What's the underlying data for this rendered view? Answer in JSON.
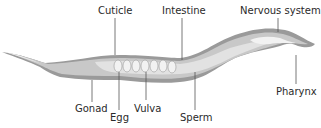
{
  "diagram": {
    "labels": {
      "cuticle": "Cuticle",
      "intestine": "Intestine",
      "nervous_system": "Nervous system",
      "gonad": "Gonad",
      "egg": "Egg",
      "vulva": "Vulva",
      "sperm": "Sperm",
      "pharynx": "Pharynx"
    },
    "colors": {
      "body_outer": "#9a9a9a",
      "body_inner": "#c8c8c8",
      "intestine": "#e2e2e2",
      "highlight": "#f2f2f2",
      "leader_line": "#555555"
    }
  }
}
